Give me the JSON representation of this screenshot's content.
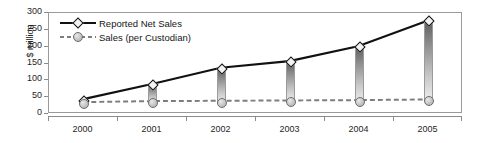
{
  "chart_data": {
    "type": "line",
    "title": "",
    "xlabel": "",
    "ylabel": "$ million",
    "categories": [
      "2000",
      "2001",
      "2002",
      "2003",
      "2004",
      "2005"
    ],
    "ylim": [
      0,
      300
    ],
    "yticks": [
      0,
      50,
      100,
      150,
      200,
      250,
      300
    ],
    "grid": false,
    "legend_position": "upper-left",
    "series": [
      {
        "name": "Reported Net Sales",
        "values": [
          39,
          85,
          134,
          154,
          199,
          276
        ],
        "marker": "diamond",
        "line_style": "solid",
        "color": "#111111"
      },
      {
        "name": "Sales (per Custodian)",
        "values": [
          30,
          33,
          34,
          35,
          36,
          38
        ],
        "marker": "circle",
        "line_style": "dashed",
        "color": "#7d7d7d"
      }
    ],
    "annotations": "Vertical gradient-filled connector bars join the two series at each year."
  },
  "axis": {
    "y_title": "$ million",
    "y_labels": [
      "300",
      "250",
      "200",
      "150",
      "100",
      "50",
      "0"
    ],
    "x_labels": [
      "2000",
      "2001",
      "2002",
      "2003",
      "2004",
      "2005"
    ]
  },
  "legend": {
    "items": [
      {
        "label": "Reported Net Sales"
      },
      {
        "label": "Sales (per Custodian)"
      }
    ]
  },
  "colors": {
    "series1": "#111111",
    "series2": "#7d7d7d",
    "bar_top": "#5e5e5e",
    "bar_bottom": "#eeeeee",
    "frame": "#9a9a9a",
    "background": "#ffffff"
  }
}
